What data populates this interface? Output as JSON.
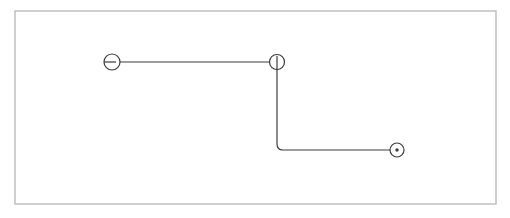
{
  "canvas": {
    "width": 510,
    "height": 218,
    "background_color": "#ffffff"
  },
  "frame": {
    "name": "diagram-frame",
    "x": 15,
    "y": 11,
    "width": 481,
    "height": 193,
    "stroke_color": "#bcbcbc",
    "stroke_width": 1.4,
    "fill_color": "#ffffff"
  },
  "style": {
    "line_color": "#3c3c3c",
    "line_width": 1.2,
    "node_stroke_color": "#3c3c3c",
    "node_fill_color": "#ffffff",
    "node_stroke_width": 1.2,
    "corner_radius": 6
  },
  "nodes": [
    {
      "id": "node-source",
      "name": "source-port-node",
      "glyph": "circle-with-horizontal-stub",
      "cx": 112,
      "cy": 62,
      "r": 8,
      "stub": {
        "x1": 104,
        "y1": 62,
        "x2": 116,
        "y2": 62
      }
    },
    {
      "id": "node-junction",
      "name": "junction-node",
      "glyph": "circle-with-vertical-stub",
      "cx": 277,
      "cy": 62,
      "r": 7.5,
      "stub": {
        "x1": 277,
        "y1": 56,
        "x2": 277,
        "y2": 70
      }
    },
    {
      "id": "node-target",
      "name": "target-terminal-node",
      "glyph": "circle-with-center-dot",
      "cx": 397,
      "cy": 150,
      "r": 7,
      "dot_r": 1.7
    }
  ],
  "edges": [
    {
      "id": "edge-source-to-junction",
      "name": "edge-source-to-junction",
      "from": "node-source",
      "to": "node-junction",
      "path": "M 120 62 L 277 62",
      "orientation": "horizontal"
    },
    {
      "id": "edge-junction-to-target",
      "name": "edge-junction-to-target",
      "from": "node-junction",
      "to": "node-target",
      "path": "M 277 70 L 277 144 Q 277 150 283 150 L 390 150",
      "orientation": "elbow-down-right"
    }
  ],
  "labels": []
}
